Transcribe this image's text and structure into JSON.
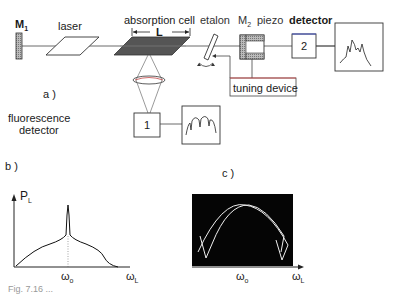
{
  "diagram": {
    "part_a": {
      "label": "a )",
      "components": {
        "mirror1": {
          "label": "M",
          "sub": "1"
        },
        "laser": {
          "label": "laser"
        },
        "absorption_cell": {
          "label": "absorption cell",
          "length_label": "L"
        },
        "etalon": {
          "label": "etalon"
        },
        "mirror2": {
          "label": "M",
          "sub": "2"
        },
        "piezo": {
          "label": "piezo"
        },
        "detector": {
          "label": "detector",
          "number": "2"
        },
        "tuning_device": {
          "label": "tuning device"
        },
        "fluorescence_detector": {
          "label_line1": "fluorescence",
          "label_line2": "detector",
          "number": "1"
        }
      }
    },
    "part_b": {
      "label": "b )",
      "y_axis": {
        "label": "P",
        "sub": "L"
      },
      "x_axis": {
        "label": "ω",
        "sub": "L"
      },
      "center_tick": {
        "label": "ω",
        "sub": "o"
      }
    },
    "part_c": {
      "label": "c )",
      "x_axis": {
        "label": "ω",
        "sub": "L"
      },
      "center_tick": {
        "label": "ω",
        "sub": "o"
      }
    },
    "caption": "Fig. 7.16 ..."
  },
  "colors": {
    "line": "#333333",
    "cell_fill": "#555555",
    "mirror_fill": "#aaaaaa",
    "scope_bg": "#050505",
    "scope_trace": "#f0f0f0",
    "tuning_accent": "#d04040",
    "detector_accent": "#4050c0"
  }
}
